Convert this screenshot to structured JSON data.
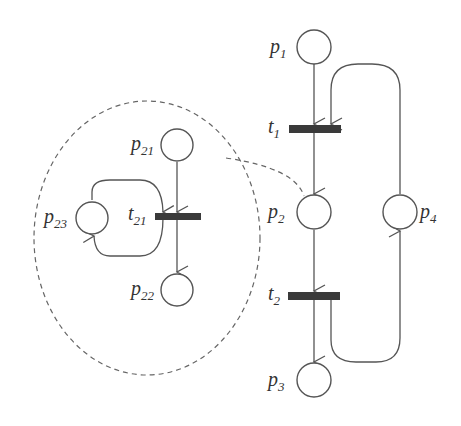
{
  "diagram": {
    "type": "petri-net",
    "places": [
      {
        "id": "p1",
        "base": "p",
        "sub": "1"
      },
      {
        "id": "p2",
        "base": "p",
        "sub": "2"
      },
      {
        "id": "p3",
        "base": "p",
        "sub": "3"
      },
      {
        "id": "p4",
        "base": "p",
        "sub": "4"
      },
      {
        "id": "p21",
        "base": "p",
        "sub": "21"
      },
      {
        "id": "p22",
        "base": "p",
        "sub": "22"
      },
      {
        "id": "p23",
        "base": "p",
        "sub": "23"
      }
    ],
    "transitions": [
      {
        "id": "t1",
        "base": "t",
        "sub": "1"
      },
      {
        "id": "t2",
        "base": "t",
        "sub": "2"
      },
      {
        "id": "t21",
        "base": "t",
        "sub": "21"
      }
    ],
    "arcs": [
      [
        "p1",
        "t1"
      ],
      [
        "t1",
        "p2"
      ],
      [
        "p2",
        "t2"
      ],
      [
        "t2",
        "p3"
      ],
      [
        "t2",
        "p4"
      ],
      [
        "p4",
        "t1"
      ],
      [
        "p21",
        "t21"
      ],
      [
        "t21",
        "p22"
      ],
      [
        "t21",
        "p23"
      ],
      [
        "p23",
        "t21"
      ]
    ],
    "refinement": {
      "of": "p2",
      "subnet": [
        "p21",
        "p22",
        "p23",
        "t21"
      ]
    }
  }
}
